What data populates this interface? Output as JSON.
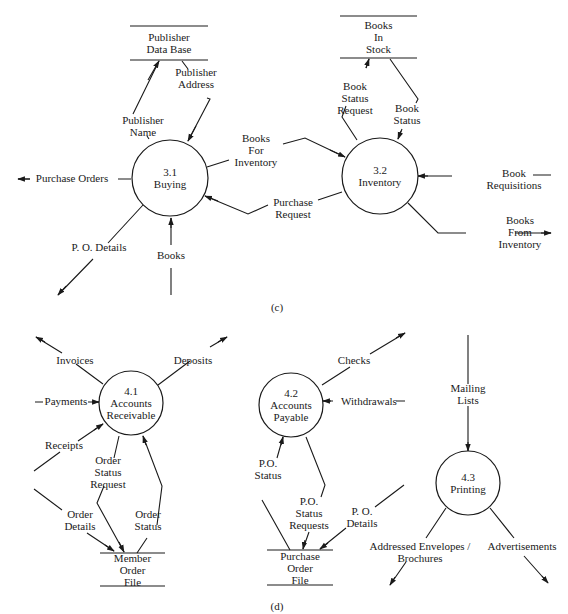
{
  "diagram_c": {
    "caption": "(c)",
    "processes": [
      {
        "id": "p31",
        "number": "3.1",
        "name": "Buying",
        "cx": 170,
        "cy": 178,
        "r": 38
      },
      {
        "id": "p32",
        "number": "3.2",
        "name": "Inventory",
        "cx": 380,
        "cy": 176,
        "r": 38
      }
    ],
    "stores": [
      {
        "id": "s_pub",
        "lines": [
          "Publisher",
          "Data Base"
        ],
        "x1": 130,
        "x2": 208,
        "yTop": 26,
        "yBot": 60
      },
      {
        "id": "s_stock",
        "lines": [
          "Books",
          "In",
          "Stock"
        ],
        "x1": 340,
        "x2": 417,
        "yTop": 16,
        "yBot": 58
      }
    ],
    "flows": [
      {
        "id": "f_pubname",
        "label": [
          "Publisher",
          "Name"
        ],
        "lx": 143,
        "ly": 124,
        "path": "M149,139 L147,136 M133,114 L159,61",
        "arrow": [
          159,
          61,
          148,
          80
        ]
      },
      {
        "id": "f_pubaddr",
        "label": [
          "Publisher",
          "Address"
        ],
        "lx": 196,
        "ly": 76,
        "path": "M182,61 L188,69 M207,98 L210,99 L188,141",
        "arrow": [
          188,
          141,
          196,
          126
        ]
      },
      {
        "id": "f_po",
        "label": [
          "Purchase Orders"
        ],
        "lx": 72,
        "ly": 182,
        "anchor": "middle",
        "path": "M118,179 L131,179 M18,179 L30,179",
        "arrow": [
          18,
          179,
          30,
          179
        ]
      },
      {
        "id": "f_bfi",
        "label": [
          "Books",
          "For",
          "Inventory"
        ],
        "lx": 256,
        "ly": 142,
        "path": "M207,167 L229,160 M283,144 L305,138 L345,157",
        "arrow": [
          345,
          157,
          330,
          150
        ]
      },
      {
        "id": "f_preq",
        "label": [
          "Purchase",
          "Request"
        ],
        "lx": 293,
        "ly": 206,
        "path": "M268,205 L248,214 L205,196 M318,200 L342,192",
        "arrow": [
          205,
          196,
          218,
          201
        ]
      },
      {
        "id": "f_pod",
        "label": [
          "P. O. Details"
        ],
        "lx": 99,
        "ly": 251,
        "anchor": "middle",
        "path": "M143,205 L108,243 M93,259 L58,295",
        "arrow": [
          58,
          295,
          66,
          286
        ]
      },
      {
        "id": "f_books",
        "label": [
          "Books"
        ],
        "lx": 171,
        "ly": 259,
        "anchor": "middle",
        "path": "M171,218 L171,245 M171,268 L171,295",
        "arrow": [
          171,
          218,
          171,
          228
        ]
      },
      {
        "id": "f_bsreq",
        "label": [
          "Book",
          "Status",
          "Request"
        ],
        "lx": 355,
        "ly": 90,
        "path": "M369,59 L366,68 M346,106 L342,117 L357,140",
        "arrow": [
          369,
          59,
          366,
          68
        ]
      },
      {
        "id": "f_bstat",
        "label": [
          "Book",
          "Status"
        ],
        "lx": 407,
        "ly": 112,
        "path": "M390,59 L418,99 L416,103 M402,129 L398,139",
        "arrow": [
          398,
          139,
          401,
          131
        ]
      },
      {
        "id": "f_breq",
        "label": [
          "Book",
          "Requisitions"
        ],
        "lx": 514,
        "ly": 177,
        "path": "M418,176 L452,176 M533,175 L551,175",
        "arrow": [
          418,
          176,
          428,
          176
        ]
      },
      {
        "id": "f_bfinv",
        "label": [
          "Books",
          "From",
          "Inventory"
        ],
        "lx": 520,
        "ly": 224,
        "path": "M408,203 L438,233 L466,233 M515,233 L551,233",
        "arrow": [
          551,
          233,
          541,
          233
        ]
      }
    ]
  },
  "diagram_d": {
    "caption": "(d)",
    "processes": [
      {
        "id": "p41",
        "number": "4.1",
        "name1": "Accounts",
        "name2": "Receivable",
        "cx": 131,
        "cy": 403,
        "r": 32
      },
      {
        "id": "p42",
        "number": "4.2",
        "name1": "Accounts",
        "name2": "Payable",
        "cx": 291,
        "cy": 405,
        "r": 32
      },
      {
        "id": "p43",
        "number": "4.3",
        "name1": "Printing",
        "name2": "",
        "cx": 468,
        "cy": 483,
        "r": 32
      }
    ],
    "stores": [
      {
        "id": "s_member",
        "lines": [
          "Member",
          "Order",
          "File"
        ],
        "x1": 100,
        "x2": 165,
        "yTop": 553,
        "yBot": 586
      },
      {
        "id": "s_pofile",
        "lines": [
          "Purchase",
          "Order",
          "File"
        ],
        "x1": 267,
        "x2": 333,
        "yTop": 550,
        "yBot": 585
      }
    ],
    "flows": [
      {
        "id": "f_inv",
        "label": [
          "Invoices"
        ],
        "lx": 75,
        "ly": 364,
        "anchor": "middle",
        "path": "M103,384 L76,364 M62,353 L36,337",
        "arrow": [
          36,
          337,
          45,
          342
        ]
      },
      {
        "id": "f_dep",
        "label": [
          "Deposits"
        ],
        "lx": 193,
        "ly": 364,
        "anchor": "middle",
        "path": "M158,385 L190,361 M210,347 L227,337",
        "arrow": [
          227,
          337,
          218,
          342
        ]
      },
      {
        "id": "f_pay",
        "label": [
          "Payments"
        ],
        "lx": 66,
        "ly": 405,
        "anchor": "middle",
        "path": "M35,402 L43,402 M88,402 L99,402",
        "arrow": [
          99,
          402,
          92,
          402
        ]
      },
      {
        "id": "f_rec",
        "label": [
          "Receipts"
        ],
        "lx": 64,
        "ly": 449,
        "anchor": "middle",
        "path": "M103,424 L78,441 M60,452 L34,471",
        "arrow": [
          103,
          424,
          94,
          430
        ]
      },
      {
        "id": "f_osr",
        "label": [
          "Order",
          "Status",
          "Request"
        ],
        "lx": 108,
        "ly": 464,
        "path": "M119,436 L114,458 M104,486 L97,503 L124,552",
        "arrow": [
          124,
          552,
          119,
          542
        ]
      },
      {
        "id": "f_os",
        "label": [
          "Order",
          "Status"
        ],
        "lx": 148,
        "ly": 518,
        "path": "M143,436 L162,486 L157,525 M147,538 L137,553",
        "arrow": [
          143,
          436,
          146,
          445
        ]
      },
      {
        "id": "f_od",
        "label": [
          "Order",
          "Details"
        ],
        "lx": 80,
        "ly": 518,
        "path": "M34,489 L62,510 M87,533 L114,551",
        "arrow": [
          114,
          551,
          105,
          545
        ]
      },
      {
        "id": "f_chk",
        "label": [
          "Checks"
        ],
        "lx": 354,
        "ly": 364,
        "anchor": "middle",
        "path": "M322,385 L350,367 M370,354 L405,333",
        "arrow": [
          405,
          333,
          396,
          338
        ]
      },
      {
        "id": "f_wd",
        "label": [
          "Withdrawals"
        ],
        "lx": 369,
        "ly": 405,
        "anchor": "middle",
        "path": "M323,401 L333,401 M396,401 L405,401",
        "arrow": [
          323,
          401,
          331,
          401
        ]
      },
      {
        "id": "f_pos",
        "label": [
          "P.O.",
          "Status"
        ],
        "lx": 268,
        "ly": 467,
        "path": "M283,437 L277,458 M262,500 L290,550",
        "arrow": [
          283,
          437,
          281,
          445
        ]
      },
      {
        "id": "f_posr",
        "label": [
          "P.O.",
          "Status",
          "Requests"
        ],
        "lx": 309,
        "ly": 505,
        "path": "M306,437 L325,485 L321,497 M309,532 L303,549",
        "arrow": [
          303,
          549,
          305,
          540
        ]
      },
      {
        "id": "f_pod2",
        "label": [
          "P. O.",
          "Details"
        ],
        "lx": 362,
        "ly": 515,
        "path": "M404,485 L375,507 M346,528 L320,549",
        "arrow": [
          320,
          549,
          328,
          543
        ]
      },
      {
        "id": "f_ml",
        "label": [
          "Mailing",
          "Lists"
        ],
        "lx": 468,
        "ly": 392,
        "anchor": "middle",
        "path": "M468,335 L468,384 M468,406 L468,451",
        "arrow": [
          468,
          451,
          468,
          442
        ]
      },
      {
        "id": "f_aeb",
        "label": [
          "Addressed Envelopes /",
          "Brochures"
        ],
        "lx": 420,
        "ly": 550,
        "anchor": "middle",
        "path": "M446,508 L426,538 M406,562 L390,585",
        "arrow": [
          390,
          585,
          395,
          577
        ]
      },
      {
        "id": "f_adv",
        "label": [
          "Advertisements"
        ],
        "lx": 522,
        "ly": 550,
        "anchor": "middle",
        "path": "M490,508 L514,538 M524,556 L548,583",
        "arrow": [
          548,
          583,
          542,
          576
        ]
      }
    ]
  }
}
